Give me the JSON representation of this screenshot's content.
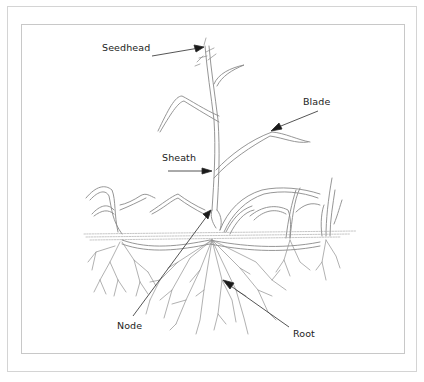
{
  "diagram": {
    "labels": {
      "seedhead": "Seedhead",
      "blade": "Blade",
      "sheath": "Sheath",
      "node": "Node",
      "root": "Root"
    },
    "colors": {
      "line": "#8a8a8a",
      "arrow": "#1a1a1a",
      "frame": "#cccccc",
      "text": "#222222"
    }
  }
}
